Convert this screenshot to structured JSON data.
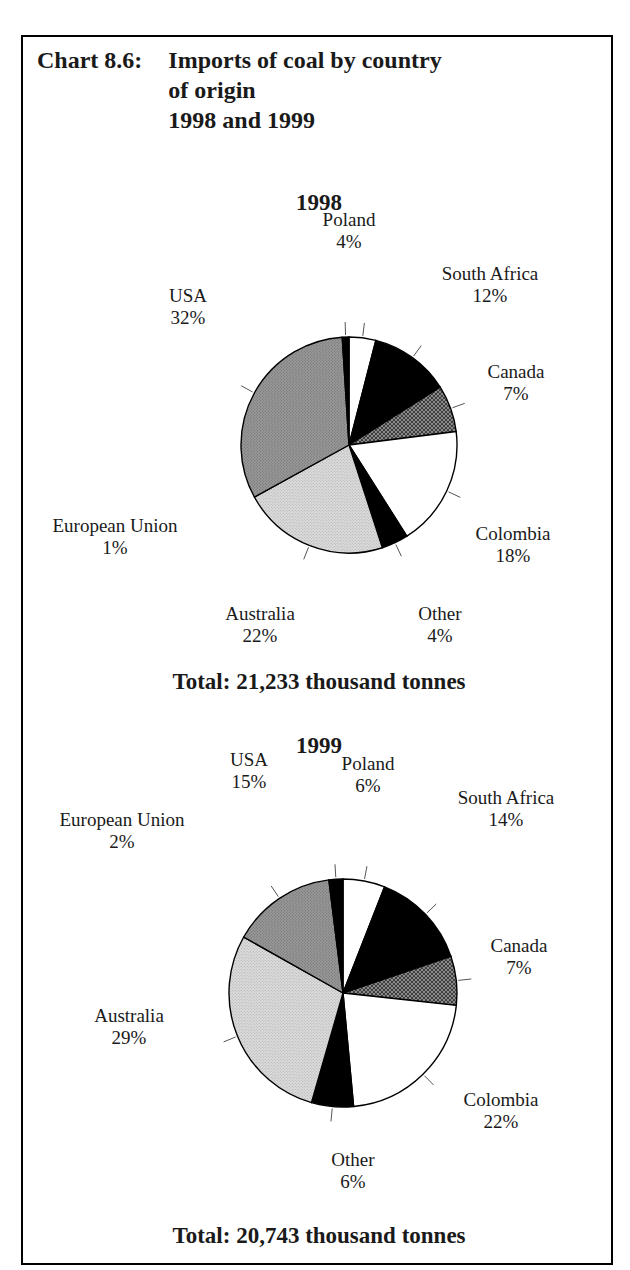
{
  "header": {
    "chart_label": "Chart 8.6:",
    "title_lines": [
      "Imports of coal by country",
      "of origin",
      "1998 and 1999"
    ]
  },
  "charts": [
    {
      "heading": "1998",
      "total": "Total: 21,233 thousand tonnes",
      "slices": [
        {
          "name": "Poland",
          "percent": 4,
          "label": "Poland",
          "value_label": "4%",
          "fill": "white"
        },
        {
          "name": "South Africa",
          "percent": 12,
          "label": "South Africa",
          "value_label": "12%",
          "fill": "black"
        },
        {
          "name": "Canada",
          "percent": 7,
          "label": "Canada",
          "value_label": "7%",
          "fill": "speckle"
        },
        {
          "name": "Colombia",
          "percent": 18,
          "label": "Colombia",
          "value_label": "18%",
          "fill": "white"
        },
        {
          "name": "Other",
          "percent": 4,
          "label": "Other",
          "value_label": "4%",
          "fill": "black"
        },
        {
          "name": "Australia",
          "percent": 22,
          "label": "Australia",
          "value_label": "22%",
          "fill": "light"
        },
        {
          "name": "USA",
          "percent": 32,
          "label": "USA",
          "value_label": "32%",
          "fill": "medium"
        },
        {
          "name": "European Union",
          "percent": 1,
          "label": "European Union",
          "value_label": "1%",
          "fill": "black"
        }
      ]
    },
    {
      "heading": "1999",
      "total": "Total: 20,743 thousand tonnes",
      "slices": [
        {
          "name": "Poland",
          "percent": 6,
          "label": "Poland",
          "value_label": "6%",
          "fill": "white"
        },
        {
          "name": "South Africa",
          "percent": 14,
          "label": "South Africa",
          "value_label": "14%",
          "fill": "black"
        },
        {
          "name": "Canada",
          "percent": 7,
          "label": "Canada",
          "value_label": "7%",
          "fill": "speckle"
        },
        {
          "name": "Colombia",
          "percent": 22,
          "label": "Colombia",
          "value_label": "22%",
          "fill": "white"
        },
        {
          "name": "Other",
          "percent": 6,
          "label": "Other",
          "value_label": "6%",
          "fill": "black"
        },
        {
          "name": "Australia",
          "percent": 29,
          "label": "Australia",
          "value_label": "29%",
          "fill": "light"
        },
        {
          "name": "USA",
          "percent": 15,
          "label": "USA",
          "value_label": "15%",
          "fill": "medium"
        },
        {
          "name": "European Union",
          "percent": 2,
          "label": "European Union",
          "value_label": "2%",
          "fill": "black"
        }
      ]
    }
  ],
  "chart_data": {
    "type": "pie",
    "title": "Chart 8.6: Imports of coal by country of origin 1998 and 1999",
    "unit": "percent of total imports",
    "legend": "labels placed outside slices with leader lines",
    "series": [
      {
        "name": "1998",
        "total": 21233,
        "total_unit": "thousand tonnes",
        "categories": [
          "Poland",
          "South Africa",
          "Canada",
          "Colombia",
          "Other",
          "Australia",
          "USA",
          "European Union"
        ],
        "values": [
          4,
          12,
          7,
          18,
          4,
          22,
          32,
          1
        ]
      },
      {
        "name": "1999",
        "total": 20743,
        "total_unit": "thousand tonnes",
        "categories": [
          "Poland",
          "South Africa",
          "Canada",
          "Colombia",
          "Other",
          "Australia",
          "USA",
          "European Union"
        ],
        "values": [
          6,
          14,
          7,
          22,
          6,
          29,
          15,
          2
        ]
      }
    ],
    "colors": {
      "white": "#ffffff",
      "black": "#000000",
      "speckle": "#8a8a8a",
      "light": "#dcdcdc",
      "medium": "#9a9a9a",
      "outline": "#000000"
    }
  },
  "layout": {
    "pies": [
      {
        "cx": 347,
        "cy": 443,
        "r": 108,
        "label_positions": [
          {
            "x": 347,
            "y": 218,
            "anchor": "middle"
          },
          {
            "x": 488,
            "y": 272,
            "anchor": "middle"
          },
          {
            "x": 514,
            "y": 370,
            "anchor": "middle"
          },
          {
            "x": 511,
            "y": 532,
            "anchor": "middle"
          },
          {
            "x": 438,
            "y": 612,
            "anchor": "middle"
          },
          {
            "x": 258,
            "y": 612,
            "anchor": "middle"
          },
          {
            "x": 186,
            "y": 294,
            "anchor": "middle"
          },
          {
            "x": 113,
            "y": 524,
            "anchor": "middle"
          }
        ]
      },
      {
        "cx": 341,
        "cy": 991,
        "r": 114,
        "label_positions": [
          {
            "x": 366,
            "y": 762,
            "anchor": "middle"
          },
          {
            "x": 504,
            "y": 796,
            "anchor": "middle"
          },
          {
            "x": 517,
            "y": 944,
            "anchor": "middle"
          },
          {
            "x": 499,
            "y": 1098,
            "anchor": "middle"
          },
          {
            "x": 351,
            "y": 1158,
            "anchor": "middle"
          },
          {
            "x": 127,
            "y": 1014,
            "anchor": "middle"
          },
          {
            "x": 247,
            "y": 758,
            "anchor": "middle"
          },
          {
            "x": 120,
            "y": 818,
            "anchor": "middle"
          }
        ]
      }
    ]
  }
}
